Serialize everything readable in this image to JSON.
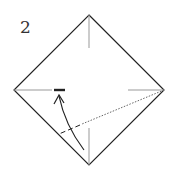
{
  "diagram": {
    "step_number": "2",
    "type": "origami-fold-step",
    "colors": {
      "outline": "#222222",
      "crease": "#888888",
      "arrow": "#222222"
    }
  }
}
